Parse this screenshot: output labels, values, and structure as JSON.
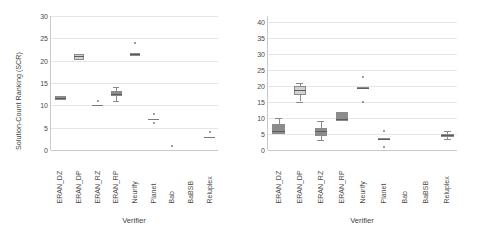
{
  "figure": {
    "background": "#ffffff",
    "box_fill_dark": "#8c8c8c",
    "box_fill_light": "#d2d2d2",
    "box_edge": "#8a8a8a",
    "gridline_color": "#e6e6e6",
    "axis_color": "#c9c9c9"
  },
  "chart_data": [
    {
      "type": "box",
      "panel": "left",
      "title": "",
      "xlabel": "Verifier",
      "ylabel": "Solution-Count Ranking (SCR)",
      "grid": true,
      "legend": "none",
      "ylim": [
        0,
        30
      ],
      "yticks": [
        0,
        5,
        10,
        15,
        20,
        25,
        30
      ],
      "categories": [
        "ERAN_DZ",
        "ERAN_DP",
        "ERAN_RZ",
        "ERAN_RP",
        "Neurify",
        "Planet",
        "Bab",
        "BaBSB",
        "Reluplex"
      ],
      "boxes": [
        {
          "category": "ERAN_DZ",
          "q1": 11.2,
          "median": 11.6,
          "q3": 12.0,
          "whisker_low": 11.2,
          "whisker_high": 12.0,
          "outliers": [],
          "fill": "dark"
        },
        {
          "category": "ERAN_DP",
          "q1": 20.2,
          "median": 21.0,
          "q3": 21.6,
          "whisker_low": 20.2,
          "whisker_high": 21.6,
          "outliers": [],
          "fill": "light"
        },
        {
          "category": "ERAN_RZ",
          "q1": 10.0,
          "median": 10.0,
          "q3": 10.0,
          "whisker_low": 10.0,
          "whisker_high": 10.0,
          "outliers": [
            11.0
          ],
          "fill": "dark"
        },
        {
          "category": "ERAN_RP",
          "q1": 12.0,
          "median": 12.6,
          "q3": 13.1,
          "whisker_low": 11.0,
          "whisker_high": 14.0,
          "outliers": [],
          "fill": "dark"
        },
        {
          "category": "Neurify",
          "q1": 21.1,
          "median": 21.5,
          "q3": 21.8,
          "whisker_low": 21.1,
          "whisker_high": 21.8,
          "outliers": [
            24.0
          ],
          "fill": "dark"
        },
        {
          "category": "Planet",
          "q1": 7.0,
          "median": 7.0,
          "q3": 7.0,
          "whisker_low": 7.0,
          "whisker_high": 7.0,
          "outliers": [
            8.0,
            6.0
          ],
          "fill": "dark"
        },
        {
          "category": "Bab",
          "q1": null,
          "median": null,
          "q3": null,
          "whisker_low": null,
          "whisker_high": null,
          "outliers": [
            1.0
          ],
          "fill": "dark"
        },
        {
          "category": "BaBSB",
          "q1": null,
          "median": null,
          "q3": null,
          "whisker_low": null,
          "whisker_high": null,
          "outliers": [],
          "fill": "dark"
        },
        {
          "category": "Reluplex",
          "q1": 3.0,
          "median": 3.0,
          "q3": 3.0,
          "whisker_low": 3.0,
          "whisker_high": 3.0,
          "outliers": [
            4.0
          ],
          "fill": "dark"
        }
      ]
    },
    {
      "type": "box",
      "panel": "right",
      "title": "",
      "xlabel": "Verifier",
      "ylabel": "",
      "grid": true,
      "legend": "none",
      "ylim": [
        0,
        42
      ],
      "yticks": [
        0,
        5,
        10,
        15,
        20,
        25,
        30,
        35,
        40
      ],
      "categories": [
        "ERAN_DZ",
        "ERAN_DP",
        "ERAN_RZ",
        "ERAN_RP",
        "Neurify",
        "Planet",
        "Bab",
        "BaBSB",
        "Reluplex"
      ],
      "boxes": [
        {
          "category": "ERAN_DZ",
          "q1": 5.0,
          "median": 6.0,
          "q3": 8.0,
          "whisker_low": 5.0,
          "whisker_high": 10.0,
          "outliers": [],
          "fill": "dark"
        },
        {
          "category": "ERAN_DP",
          "q1": 17.3,
          "median": 18.8,
          "q3": 20.0,
          "whisker_low": 15.2,
          "whisker_high": 21.0,
          "outliers": [],
          "fill": "light"
        },
        {
          "category": "ERAN_RZ",
          "q1": 4.5,
          "median": 6.0,
          "q3": 7.0,
          "whisker_low": 3.0,
          "whisker_high": 9.0,
          "outliers": [],
          "fill": "dark"
        },
        {
          "category": "ERAN_RP",
          "q1": 9.0,
          "median": 9.6,
          "q3": 12.0,
          "whisker_low": 9.0,
          "whisker_high": 12.0,
          "outliers": [],
          "fill": "dark"
        },
        {
          "category": "Neurify",
          "q1": 19.2,
          "median": 19.5,
          "q3": 19.9,
          "whisker_low": 19.2,
          "whisker_high": 19.9,
          "outliers": [
            23.0,
            15.2
          ],
          "fill": "dark"
        },
        {
          "category": "Planet",
          "q1": 3.2,
          "median": 3.5,
          "q3": 3.8,
          "whisker_low": 3.2,
          "whisker_high": 3.8,
          "outliers": [
            6.0,
            1.0
          ],
          "fill": "dark"
        },
        {
          "category": "Bab",
          "q1": null,
          "median": null,
          "q3": null,
          "whisker_low": null,
          "whisker_high": null,
          "outliers": [],
          "fill": "dark"
        },
        {
          "category": "BaBSB",
          "q1": null,
          "median": null,
          "q3": null,
          "whisker_low": null,
          "whisker_high": null,
          "outliers": [],
          "fill": "dark"
        },
        {
          "category": "Reluplex",
          "q1": 4.0,
          "median": 4.6,
          "q3": 5.0,
          "whisker_low": 3.4,
          "whisker_high": 6.0,
          "outliers": [],
          "fill": "dark"
        }
      ]
    }
  ]
}
